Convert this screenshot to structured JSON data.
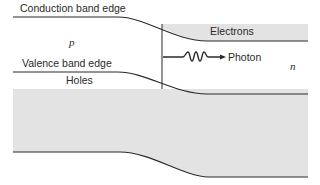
{
  "diagram": {
    "labels": {
      "conduction_band": "Conduction band edge",
      "valence_band": "Valence band edge",
      "electrons": "Electrons",
      "holes": "Holes",
      "photon": "Photon",
      "p_region": "p",
      "n_region": "n"
    },
    "colors": {
      "line": "#2b2b2b",
      "shade": "#e3e3e3",
      "background": "#ffffff"
    }
  }
}
